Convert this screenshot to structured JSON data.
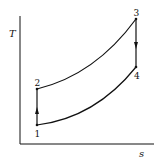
{
  "diagram": {
    "type": "T-s diagram",
    "axes": {
      "y_label": "T",
      "x_label": "s"
    },
    "points": [
      {
        "id": "1",
        "label": "1"
      },
      {
        "id": "2",
        "label": "2"
      },
      {
        "id": "3",
        "label": "3"
      },
      {
        "id": "4",
        "label": "4"
      }
    ],
    "processes": [
      {
        "from": "1",
        "to": "2",
        "kind": "vertical",
        "direction": "up"
      },
      {
        "from": "2",
        "to": "3",
        "kind": "curve"
      },
      {
        "from": "3",
        "to": "4",
        "kind": "vertical",
        "direction": "down"
      },
      {
        "from": "4",
        "to": "1",
        "kind": "curve"
      }
    ],
    "colors": {
      "line": "#111111",
      "background": "#ffffff"
    }
  }
}
